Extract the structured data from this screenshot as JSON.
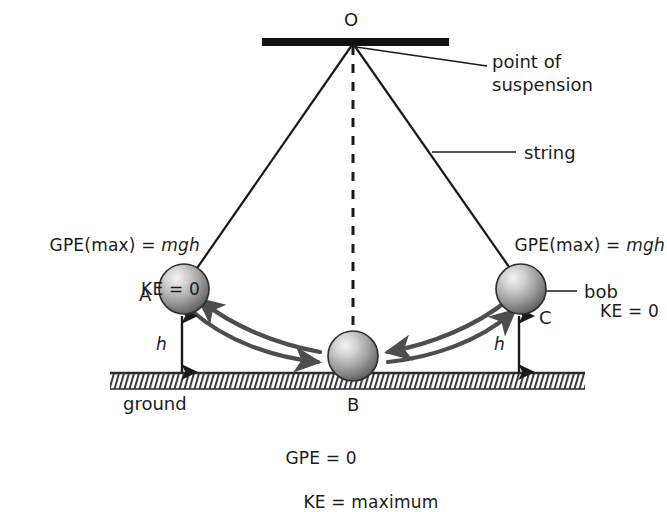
{
  "diagram": {
    "title_visible": false,
    "pivot_label": "O",
    "support_label": "point of suspension",
    "support_label_line1": "point of",
    "support_label_line2": "suspension",
    "string_label": "string",
    "bob_label": "bob",
    "ground_label": "ground",
    "positions": {
      "a": "A",
      "b": "B",
      "c": "C"
    },
    "height_symbol_left": "h",
    "height_symbol_right": "h",
    "energy_left": {
      "line1_prefix": "GPE(max) = ",
      "line1_italic": "mgh",
      "line2": "KE = 0"
    },
    "energy_right": {
      "line1_prefix": "GPE(max) = ",
      "line1_italic": "mgh",
      "line2": "KE = 0"
    },
    "energy_bottom": {
      "line1": "GPE = 0",
      "line2": "KE = maximum"
    },
    "colors": {
      "ink": "#1a1a1a",
      "arrow": "#4d4d4d",
      "sphere_light": "#e8e8e8",
      "sphere_mid": "#9a9a9a",
      "sphere_dark": "#5a5a5a",
      "ground_hatch": "#3a3a3a",
      "support_bar": "#111111"
    }
  }
}
